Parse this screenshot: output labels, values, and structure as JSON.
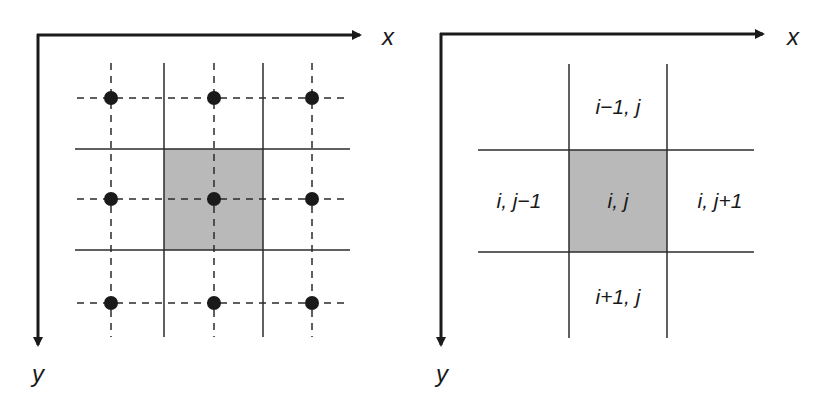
{
  "colors": {
    "line": "#2b2b2b",
    "axis": "#1a1a1a",
    "shaded_cell": "#b9b9b9",
    "node": "#1a1a1a",
    "background": "#ffffff"
  },
  "left_diagram": {
    "title": "cell-centered grid with nodes",
    "x_axis_label": "x",
    "y_axis_label": "y",
    "axis": {
      "origin": [
        38,
        35
      ],
      "x_end": 362,
      "y_end": 347
    },
    "grid_lines_vertical": [
      164,
      263
    ],
    "grid_lines_horizontal": [
      149,
      250
    ],
    "grid_extent": {
      "x_min": 75,
      "x_max": 350,
      "y_min": 63,
      "y_max": 337
    },
    "shaded_cell": {
      "x": 164,
      "y": 149,
      "w": 99,
      "h": 101
    },
    "node_columns": [
      111,
      214,
      312
    ],
    "node_rows": [
      98,
      199,
      303
    ],
    "node_radius": 7,
    "nodes_count": 9
  },
  "right_diagram": {
    "title": "cell index stencil",
    "x_axis_label": "x",
    "y_axis_label": "y",
    "axis": {
      "origin": [
        441,
        34
      ],
      "x_end": 765,
      "y_end": 347
    },
    "grid_lines_vertical": [
      569,
      667
    ],
    "grid_lines_horizontal": [
      150,
      252
    ],
    "grid_extent": {
      "x_min": 478,
      "x_max": 754,
      "y_min": 64,
      "y_max": 338
    },
    "shaded_cell": {
      "x": 569,
      "y": 150,
      "w": 98,
      "h": 102
    },
    "cells": {
      "north": "i−1, j",
      "west": "i, j−1",
      "center": "i, j",
      "east": "i, j+1",
      "south": "i+1, j"
    }
  }
}
